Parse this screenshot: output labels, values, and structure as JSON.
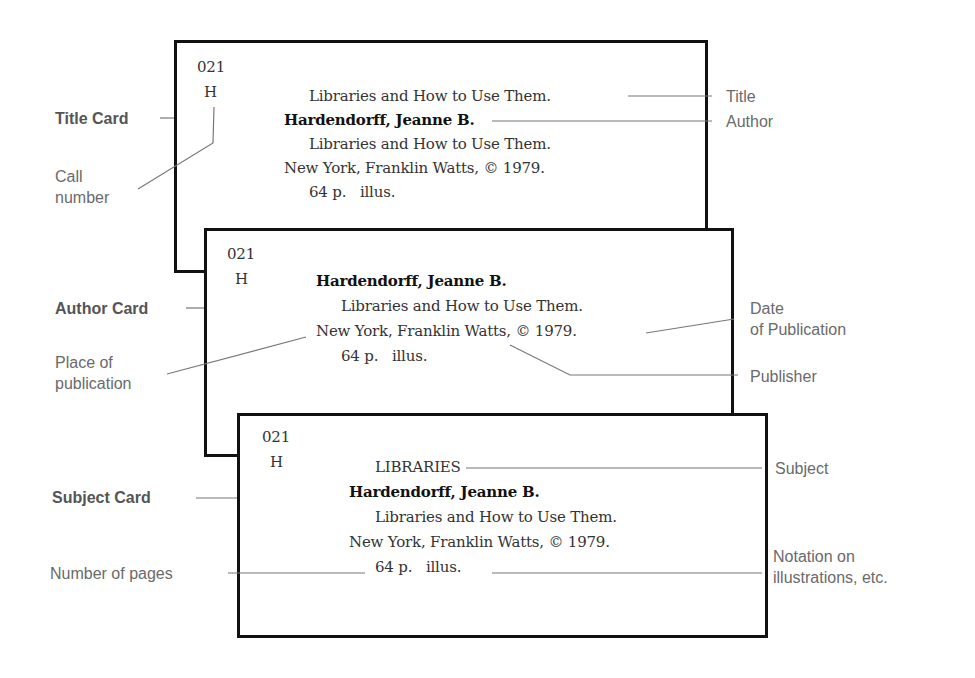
{
  "colors": {
    "card_border": "#111111",
    "leader_line": "#777777",
    "label_text": "#6a6a6a",
    "card_text": "#333333"
  },
  "cards": {
    "title_card": {
      "label": "Title Card",
      "call_number": [
        "021",
        "H"
      ],
      "lines": [
        "Libraries and How to Use Them.",
        "Hardendorff, Jeanne B.",
        "Libraries and How to Use Them.",
        "New York, Franklin Watts, © 1979.",
        "64 p.   illus."
      ]
    },
    "author_card": {
      "label": "Author Card",
      "call_number": [
        "021",
        "H"
      ],
      "lines": [
        "Hardendorff, Jeanne B.",
        "Libraries and How to Use Them.",
        "New York, Franklin Watts, © 1979.",
        "64 p.   illus."
      ]
    },
    "subject_card": {
      "label": "Subject Card",
      "call_number": [
        "021",
        "H"
      ],
      "lines": [
        "LIBRARIES",
        "Hardendorff, Jeanne B.",
        "Libraries and How to Use Them.",
        "New York, Franklin Watts, © 1979.",
        "64 p.   illus."
      ]
    }
  },
  "annotations": {
    "call_number": [
      "Call",
      "number"
    ],
    "title": "Title",
    "author": "Author",
    "date_of_publication": [
      "Date",
      "of Publication"
    ],
    "publisher": "Publisher",
    "place_of_publication": [
      "Place of",
      "publication"
    ],
    "subject": "Subject",
    "number_of_pages": "Number of pages",
    "notation": [
      "Notation on",
      "illustrations, etc."
    ]
  }
}
